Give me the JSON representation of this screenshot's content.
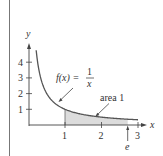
{
  "chart_data": {
    "type": "area",
    "title": "",
    "function_label": {
      "lhs": "f(x) =",
      "numerator": "1",
      "denominator": "x"
    },
    "xlabel": "x",
    "ylabel": "y",
    "x_ticks": [
      1,
      2,
      3
    ],
    "x_tick_labels": [
      "1",
      "2",
      "3"
    ],
    "y_ticks": [
      1,
      2,
      3,
      4
    ],
    "y_tick_labels": [
      "1",
      "2",
      "3",
      "4"
    ],
    "xlim": [
      0,
      3.2
    ],
    "ylim": [
      0,
      4.9
    ],
    "grid": false,
    "curve": {
      "function": "1/x",
      "x": [
        0.21,
        0.25,
        0.3,
        0.4,
        0.5,
        0.75,
        1,
        1.5,
        2,
        2.5,
        2.718,
        3
      ],
      "y": [
        4.76,
        4.0,
        3.33,
        2.5,
        2.0,
        1.33,
        1.0,
        0.67,
        0.5,
        0.4,
        0.368,
        0.333
      ]
    },
    "shaded_region": {
      "x_from": 1,
      "x_to": 2.718,
      "area": 1,
      "label": "area 1"
    },
    "annotations": [
      {
        "text": "area 1",
        "points_to": "shaded region"
      },
      {
        "text": "e",
        "x": 2.718,
        "points_to": "x-axis"
      }
    ],
    "colors": {
      "curve": "#555555",
      "shade": "#dcdcdc",
      "axis": "#444444"
    }
  },
  "labels": {
    "func_lhs": "f(x) =",
    "func_num": "1",
    "func_den": "x",
    "area": "area 1",
    "e": "e",
    "x_axis": "x",
    "y_axis": "y",
    "x1": "1",
    "x2": "2",
    "x3": "3",
    "y1": "1",
    "y2": "2",
    "y3": "3",
    "y4": "4"
  }
}
